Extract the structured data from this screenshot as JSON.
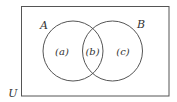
{
  "diagram": {
    "type": "venn",
    "universe_label": "U",
    "sets": [
      {
        "name": "A",
        "label": "A"
      },
      {
        "name": "B",
        "label": "B"
      }
    ],
    "regions": [
      {
        "id": "a",
        "label": "(a)",
        "description": "A only"
      },
      {
        "id": "b",
        "label": "(b)",
        "description": "A and B"
      },
      {
        "id": "c",
        "label": "(c)",
        "description": "B only"
      }
    ],
    "colors": {
      "stroke": "#555555",
      "text": "#333333",
      "background": "#ffffff"
    }
  }
}
